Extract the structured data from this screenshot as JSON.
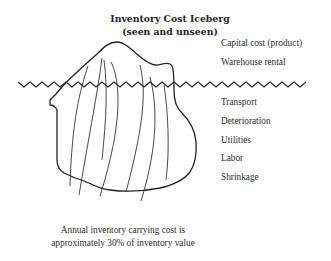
{
  "diagram": {
    "title_line1": "Inventory Cost Iceberg",
    "title_line2": "(seen and unseen)",
    "above_water_labels": [
      "Capital cost (product)",
      "Warehouse rental"
    ],
    "below_water_labels": [
      "Transport",
      "Deterioration",
      "Utilities",
      "Labor",
      "Shrinkage"
    ],
    "caption_line1": "Annual inventory carrying cost is",
    "caption_line2": "approximately 30% of inventory value",
    "shapes": {
      "iceberg": "iceberg-outline",
      "waterline": "wavy-waterline"
    },
    "colors": {
      "stroke": "#222222",
      "background": "#ffffff"
    }
  }
}
